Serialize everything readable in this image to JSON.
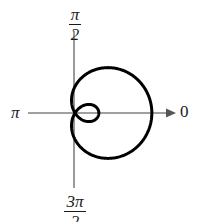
{
  "figure": {
    "background_color": "#ffffff",
    "curve_color": "#000000",
    "axis_color": "#808080"
  },
  "labels": {
    "zero": "0",
    "pi": "π",
    "half_pi_numerator": "π",
    "half_pi_denominator": "2",
    "three_half_pi_numerator": "3π",
    "three_half_pi_denominator": "2"
  },
  "chart_data": {
    "type": "line",
    "plot_kind": "polar",
    "title": "",
    "xlabel": "",
    "ylabel": "",
    "grid": false,
    "legend": "none",
    "axes": {
      "kind": "polar-cross",
      "pole_px": [
        75,
        113
      ],
      "horizontal_axis_px": {
        "x_start": 28,
        "x_end": 172,
        "y": 113,
        "arrow": "right"
      },
      "vertical_axis_px": {
        "y_start": 30,
        "y_end": 188,
        "x": 74,
        "arrow": "none"
      },
      "angle_tick_labels": [
        "0",
        "π/2",
        "π",
        "3π/2"
      ],
      "angle_tick_positions_deg": [
        0,
        90,
        180,
        270
      ]
    },
    "equation": "r = a + b cos(theta),  b > a  (limacon with inner loop)",
    "parameters": {
      "a": 1.0,
      "b": 1.9
    },
    "pixel_scale_per_unit": 26.5,
    "features": {
      "outer_loop_rightmost_px": [
        152,
        113
      ],
      "outer_loop_top_px": [
        112,
        69
      ],
      "outer_loop_bottom_px": [
        112,
        163
      ],
      "outer_loop_leftmost_px": [
        66,
        118
      ],
      "inner_loop_rightmost_px": [
        103,
        113
      ],
      "inner_loop_top_px": [
        88,
        100
      ],
      "inner_loop_bottom_px": [
        88,
        127
      ],
      "self_intersection_px": [
        75,
        113
      ]
    },
    "theta_deg": [
      0,
      15,
      30,
      45,
      60,
      75,
      90,
      105,
      120,
      135,
      150,
      165,
      180,
      195,
      210,
      225,
      240,
      255,
      270,
      285,
      300,
      315,
      330,
      345,
      360
    ],
    "r": [
      2.9,
      2.84,
      2.65,
      2.34,
      1.95,
      1.49,
      1.0,
      0.51,
      0.05,
      -0.34,
      -0.65,
      -0.84,
      -0.9,
      -0.84,
      -0.65,
      -0.34,
      0.05,
      0.51,
      1.0,
      1.49,
      1.95,
      2.34,
      2.65,
      2.84,
      2.9
    ]
  }
}
